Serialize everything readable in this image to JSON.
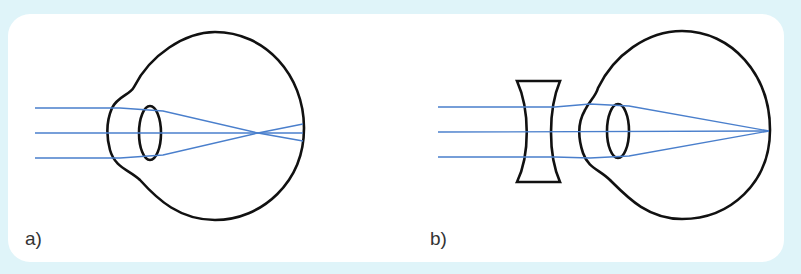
{
  "figure": {
    "colors": {
      "background": "#dff4f9",
      "panel": "#ffffff",
      "ray": "#4a7fcc",
      "outline": "#111111"
    },
    "panels": [
      {
        "id": "a",
        "label": "a)",
        "content": "Eye with parallel rays focusing in front of the retina"
      },
      {
        "id": "b",
        "label": "b)",
        "content": "Concave (diverging) lens in front of eye; rays focus on the retina"
      }
    ]
  }
}
